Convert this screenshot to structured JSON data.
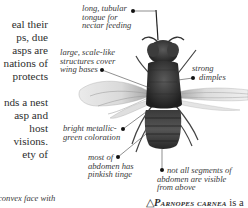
{
  "body_text": {
    "lines": [
      "eal their",
      "ps, due",
      "asps are",
      "nations of",
      "protects",
      "",
      "nds a nest",
      "asp and",
      "host",
      "visions.",
      "ety of"
    ]
  },
  "illustration": {
    "subject": "Parnopes carnea cuckoo wasp, dorsal view",
    "rendering": "grayscale photograph"
  },
  "callouts": [
    {
      "id": "tongue",
      "lines": [
        "long, tubular",
        "tongue for",
        "nectar feeding"
      ]
    },
    {
      "id": "wing-bases",
      "lines": [
        "large, scale-like",
        "structures cover",
        "wing bases"
      ]
    },
    {
      "id": "dimples",
      "lines": [
        "strong",
        "dimples"
      ]
    },
    {
      "id": "coloration",
      "lines": [
        "bright metallic-",
        "green coloration"
      ]
    },
    {
      "id": "abdomen-tinge",
      "lines": [
        "most of",
        "abdomen has",
        "pinkish tinge"
      ]
    },
    {
      "id": "segments",
      "lines": [
        "not all segments of",
        "abdomen are visible",
        "from above"
      ]
    }
  ],
  "bottom_left_italic": "convex face with",
  "caption": {
    "symbol": "△",
    "species": "Parnopes carnea",
    "rest": " is a"
  }
}
